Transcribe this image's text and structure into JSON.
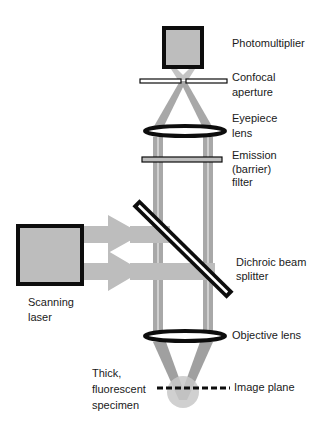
{
  "diagram": {
    "type": "confocal-microscope-schematic",
    "colors": {
      "beam": "#b5b5b5",
      "beam_dark": "#9a9a9a",
      "box_fill": "#bdbdbd",
      "outline": "#0d0d0d",
      "background": "#ffffff"
    },
    "labels": {
      "photomultiplier": "Photomultiplier",
      "confocal_aperture": [
        "Confocal",
        "aperture"
      ],
      "eyepiece_lens": [
        "Eyepiece",
        "lens"
      ],
      "emission_filter": [
        "Emission",
        "(barrier)",
        "filter"
      ],
      "dichroic_splitter": [
        "Dichroic beam",
        "splitter"
      ],
      "scanning_laser": [
        "Scanning",
        "laser"
      ],
      "objective_lens": "Objective lens",
      "specimen": [
        "Thick,",
        "fluorescent",
        "specimen"
      ],
      "image_plane": "Image plane"
    }
  }
}
